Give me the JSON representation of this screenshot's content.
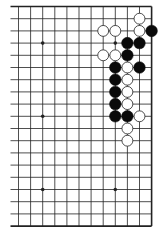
{
  "diagram": {
    "type": "go-board-partial",
    "board_size": 19,
    "visible_columns": 12,
    "visible_rows": 19,
    "view": "right side (columns 8-19), full height",
    "edges": {
      "top": true,
      "right": true,
      "bottom": true,
      "left": false
    },
    "grid": {
      "origin_x": 18.5,
      "origin_y": 6.5,
      "spacing_x": 12.1,
      "spacing_y": 12.2
    },
    "colors": {
      "background": "#ffffff",
      "line": "#222222",
      "black_stone": "#0a0a0a",
      "white_stone": "#ffffff",
      "white_stone_outline": "#222222"
    },
    "star_points": [
      {
        "col": 2,
        "row": 3
      },
      {
        "col": 8,
        "row": 3
      },
      {
        "col": 2,
        "row": 9
      },
      {
        "col": 2,
        "row": 15
      },
      {
        "col": 8,
        "row": 15
      }
    ],
    "stones": {
      "black": [
        {
          "col": 11,
          "row": 2
        },
        {
          "col": 9,
          "row": 3
        },
        {
          "col": 10,
          "row": 3
        },
        {
          "col": 9,
          "row": 4
        },
        {
          "col": 8,
          "row": 5
        },
        {
          "col": 10,
          "row": 5
        },
        {
          "col": 8,
          "row": 6
        },
        {
          "col": 8,
          "row": 7
        },
        {
          "col": 8,
          "row": 8
        },
        {
          "col": 8,
          "row": 9
        },
        {
          "col": 9,
          "row": 9
        }
      ],
      "white": [
        {
          "col": 10,
          "row": 1
        },
        {
          "col": 7,
          "row": 2
        },
        {
          "col": 8,
          "row": 2
        },
        {
          "col": 10,
          "row": 2
        },
        {
          "col": 7,
          "row": 4
        },
        {
          "col": 8,
          "row": 4
        },
        {
          "col": 9,
          "row": 5
        },
        {
          "col": 9,
          "row": 6
        },
        {
          "col": 9,
          "row": 7
        },
        {
          "col": 9,
          "row": 8
        },
        {
          "col": 10,
          "row": 9
        },
        {
          "col": 9,
          "row": 10
        },
        {
          "col": 9,
          "row": 11
        }
      ]
    }
  }
}
